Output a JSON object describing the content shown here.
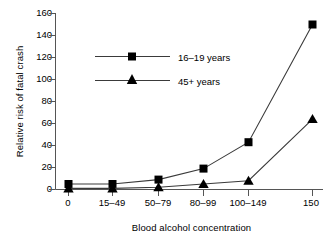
{
  "chart_data": {
    "type": "line",
    "title": "",
    "xlabel": "Blood alcohol concentration",
    "ylabel": "Relative risk of fatal crash",
    "categories": [
      "0",
      "15–49",
      "50–79",
      "80–99",
      "100–149",
      "150"
    ],
    "yticks": [
      0,
      20,
      40,
      60,
      80,
      100,
      120,
      140,
      160
    ],
    "ylim": [
      0,
      160
    ],
    "grid": false,
    "legend_position": "upper-left-inside",
    "series": [
      {
        "name": "16–19 years",
        "marker": "square",
        "values": [
          5,
          5,
          9,
          19,
          43,
          150
        ]
      },
      {
        "name": "45+ years",
        "marker": "triangle",
        "values": [
          1,
          1,
          2,
          5,
          8,
          64
        ]
      }
    ],
    "colors": {
      "marker": "#000000",
      "line": "#3a3a3a",
      "axis": "#555555",
      "background": "#ffffff"
    }
  },
  "axis": {
    "y_labels": [
      "160",
      "140",
      "120",
      "100",
      "80",
      "60",
      "40",
      "20",
      "0"
    ],
    "x_labels": [
      "0",
      "15–49",
      "50–79",
      "80–99",
      "100–149",
      "150"
    ],
    "y_title": "Relative risk of fatal crash",
    "x_title": "Blood alcohol concentration"
  },
  "legend": {
    "entries": [
      {
        "label": "16–19 years"
      },
      {
        "label": "45+ years"
      }
    ]
  }
}
